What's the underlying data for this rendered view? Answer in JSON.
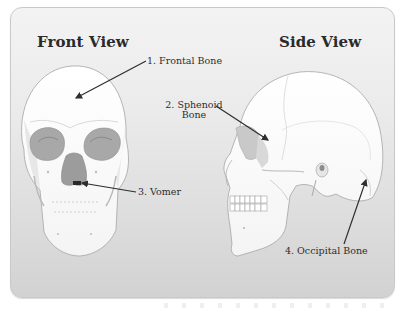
{
  "diagram": {
    "panel": {
      "background_top": "#f3f3f3",
      "background_bottom": "#d2d2d2",
      "border": "#c9c9c9"
    },
    "front_view": {
      "title": "Front View",
      "labels": [
        {
          "number": 1,
          "text": "1. Frontal Bone"
        },
        {
          "number": 3,
          "text": "3. Vomer"
        }
      ]
    },
    "side_view": {
      "title": "Side View",
      "labels": [
        {
          "number": 2,
          "text_line1": "2. Sphenoid",
          "text_line2": "Bone"
        },
        {
          "number": 4,
          "text": "4. Occipital Bone"
        }
      ]
    },
    "colors": {
      "bone": "#fbfbfb",
      "bone_outline": "#9a9a9a",
      "cavity": "#a9a9a9",
      "arrow": "#2e2e2e",
      "text": "#2d2d2d"
    }
  }
}
